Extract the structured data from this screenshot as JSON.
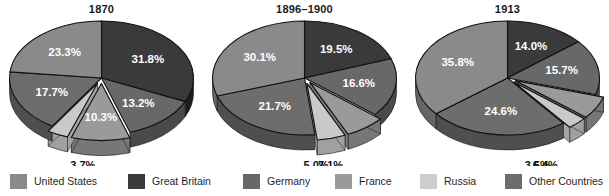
{
  "chart_data": [
    {
      "type": "pie",
      "title": "1870",
      "categories": [
        "Great Britain",
        "Germany",
        "France",
        "Russia",
        "United States",
        "Other Countries"
      ],
      "labels": [
        "31.8%",
        "13.2%",
        "10.3%",
        "3.7%",
        "17.7%",
        "23.3%"
      ],
      "values": [
        31.8,
        13.2,
        10.3,
        3.7,
        17.7,
        23.3
      ],
      "exploded": [
        false,
        false,
        true,
        true,
        false,
        false
      ],
      "legend": "shared"
    },
    {
      "type": "pie",
      "title": "1896–1900",
      "categories": [
        "Great Britain",
        "Germany",
        "France",
        "Russia",
        "United States",
        "Other Countries"
      ],
      "labels": [
        "19.5%",
        "16.6%",
        "7.1%",
        "5.0%",
        "21.7%",
        "30.1%"
      ],
      "values": [
        19.5,
        16.6,
        7.1,
        5.0,
        21.7,
        30.1
      ],
      "exploded": [
        false,
        false,
        true,
        true,
        false,
        false
      ],
      "legend": "shared"
    },
    {
      "type": "pie",
      "title": "1913",
      "categories": [
        "Great Britain",
        "Germany",
        "France",
        "Russia",
        "United States",
        "Other Countries"
      ],
      "labels": [
        "14.0%",
        "15.7%",
        "6.4%",
        "3.5%",
        "24.6%",
        "35.8%"
      ],
      "values": [
        14.0,
        15.7,
        6.4,
        3.5,
        24.6,
        35.8
      ],
      "exploded": [
        false,
        false,
        true,
        true,
        false,
        false
      ],
      "legend": "shared"
    }
  ],
  "charts": [
    {
      "title": "1870",
      "slices": [
        {
          "name": "Great Britain",
          "label": "31.8%",
          "value": 31.8,
          "color": "#3a3a3a",
          "side": "#1d1d1d",
          "exploded": false,
          "inner": true
        },
        {
          "name": "Germany",
          "label": "13.2%",
          "value": 13.2,
          "color": "#686868",
          "side": "#4a4a4a",
          "exploded": false,
          "inner": true
        },
        {
          "name": "France",
          "label": "10.3%",
          "value": 10.3,
          "color": "#9a9a9a",
          "side": "#777777",
          "exploded": true,
          "inner": true
        },
        {
          "name": "Russia",
          "label": "3.7%",
          "value": 3.7,
          "color": "#c9c9c9",
          "side": "#a0a0a0",
          "exploded": true,
          "inner": false
        },
        {
          "name": "United States",
          "label": "17.7%",
          "value": 17.7,
          "color": "#6d6d6d",
          "side": "#4f4f4f",
          "exploded": false,
          "inner": true
        },
        {
          "name": "Other Countries",
          "label": "23.3%",
          "value": 23.3,
          "color": "#8a8a8a",
          "side": "#666666",
          "exploded": false,
          "inner": true
        }
      ]
    },
    {
      "title": "1896–1900",
      "slices": [
        {
          "name": "Great Britain",
          "label": "19.5%",
          "value": 19.5,
          "color": "#3a3a3a",
          "side": "#1d1d1d",
          "exploded": false,
          "inner": true
        },
        {
          "name": "Germany",
          "label": "16.6%",
          "value": 16.6,
          "color": "#686868",
          "side": "#4a4a4a",
          "exploded": false,
          "inner": true
        },
        {
          "name": "France",
          "label": "7.1%",
          "value": 7.1,
          "color": "#9a9a9a",
          "side": "#777777",
          "exploded": true,
          "inner": false
        },
        {
          "name": "Russia",
          "label": "5.0%",
          "value": 5.0,
          "color": "#c9c9c9",
          "side": "#a0a0a0",
          "exploded": true,
          "inner": false
        },
        {
          "name": "United States",
          "label": "21.7%",
          "value": 21.7,
          "color": "#6d6d6d",
          "side": "#4f4f4f",
          "exploded": false,
          "inner": true
        },
        {
          "name": "Other Countries",
          "label": "30.1%",
          "value": 30.1,
          "color": "#8a8a8a",
          "side": "#666666",
          "exploded": false,
          "inner": true
        }
      ]
    },
    {
      "title": "1913",
      "slices": [
        {
          "name": "Great Britain",
          "label": "14.0%",
          "value": 14.0,
          "color": "#3a3a3a",
          "side": "#1d1d1d",
          "exploded": false,
          "inner": true
        },
        {
          "name": "Germany",
          "label": "15.7%",
          "value": 15.7,
          "color": "#686868",
          "side": "#4a4a4a",
          "exploded": false,
          "inner": true
        },
        {
          "name": "France",
          "label": "6.4%",
          "value": 6.4,
          "color": "#9a9a9a",
          "side": "#777777",
          "exploded": true,
          "inner": false
        },
        {
          "name": "Russia",
          "label": "3.5%",
          "value": 3.5,
          "color": "#c9c9c9",
          "side": "#a0a0a0",
          "exploded": true,
          "inner": false
        },
        {
          "name": "United States",
          "label": "24.6%",
          "value": 24.6,
          "color": "#6d6d6d",
          "side": "#4f4f4f",
          "exploded": false,
          "inner": true
        },
        {
          "name": "Other Countries",
          "label": "35.8%",
          "value": 35.8,
          "color": "#8a8a8a",
          "side": "#666666",
          "exploded": false,
          "inner": true
        }
      ]
    }
  ],
  "legend": {
    "items": [
      {
        "label": "United States",
        "color": "#8a8a8a",
        "x": 10
      },
      {
        "label": "Great Britain",
        "color": "#3a3a3a",
        "x": 128
      },
      {
        "label": "Germany",
        "color": "#686868",
        "x": 243
      },
      {
        "label": "France",
        "color": "#9a9a9a",
        "x": 335
      },
      {
        "label": "Russia",
        "color": "#cdcdcd",
        "x": 420
      },
      {
        "label": "Other Countries",
        "color": "#6d6d6d",
        "x": 505
      }
    ]
  }
}
